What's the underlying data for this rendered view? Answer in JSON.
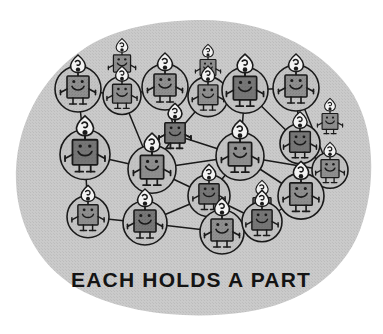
{
  "illustration": {
    "title": "each-holds-a-part-network-illustration",
    "caption": "EACH HOLDS A PART",
    "background_color": "#ffffff",
    "blob_color": "#c9c9c9",
    "blob_texture_color": "#bdbdbd",
    "figure_body_color": "#8c8c8c",
    "figure_body_dark_color": "#707070",
    "figure_outline_color": "#1a1a1a",
    "node_circle_fill": "#c2c2c2",
    "flame_color": "#f2f2f2",
    "link_color": "#1a1a1a",
    "caption_color": "#141414",
    "icon_names": [
      "candle-figure-icon",
      "flame-icon",
      "smiley-face-icon",
      "network-link-icon",
      "node-circle-icon",
      "blob-shape-icon"
    ],
    "counts": {
      "figures": 22,
      "links": 33,
      "circled_nodes": 14
    },
    "figures": [
      {
        "id": "f01",
        "x": 78,
        "y": 85,
        "scale": 1.0,
        "circled": true,
        "circle_r": 23,
        "tone": "light"
      },
      {
        "id": "f02",
        "x": 122,
        "y": 92,
        "scale": 0.86,
        "circled": true,
        "circle_r": 19,
        "tone": "mid"
      },
      {
        "id": "f03",
        "x": 165,
        "y": 83,
        "scale": 1.0,
        "circled": true,
        "circle_r": 23,
        "tone": "light"
      },
      {
        "id": "f04",
        "x": 208,
        "y": 93,
        "scale": 0.9,
        "circled": true,
        "circle_r": 20,
        "tone": "mid"
      },
      {
        "id": "f05",
        "x": 245,
        "y": 86,
        "scale": 1.06,
        "circled": true,
        "circle_r": 23,
        "tone": "dark"
      },
      {
        "id": "f06",
        "x": 296,
        "y": 84,
        "scale": 1.0,
        "circled": true,
        "circle_r": 23,
        "tone": "light"
      },
      {
        "id": "f07",
        "x": 85,
        "y": 150,
        "scale": 1.14,
        "circled": true,
        "circle_r": 25,
        "tone": "dark"
      },
      {
        "id": "f08",
        "x": 175,
        "y": 131,
        "scale": 0.92,
        "circled": false,
        "circle_r": 0,
        "tone": "dark"
      },
      {
        "id": "f09",
        "x": 152,
        "y": 165,
        "scale": 1.06,
        "circled": true,
        "circle_r": 24,
        "tone": "light"
      },
      {
        "id": "f10",
        "x": 240,
        "y": 152,
        "scale": 1.06,
        "circled": true,
        "circle_r": 24,
        "tone": "light"
      },
      {
        "id": "f11",
        "x": 300,
        "y": 140,
        "scale": 0.94,
        "circled": true,
        "circle_r": 20,
        "tone": "dark"
      },
      {
        "id": "f12",
        "x": 330,
        "y": 167,
        "scale": 0.82,
        "circled": true,
        "circle_r": 18,
        "tone": "mid"
      },
      {
        "id": "f13",
        "x": 209,
        "y": 192,
        "scale": 0.92,
        "circled": true,
        "circle_r": 21,
        "tone": "dark"
      },
      {
        "id": "f14",
        "x": 301,
        "y": 192,
        "scale": 1.02,
        "circled": true,
        "circle_r": 23,
        "tone": "light"
      },
      {
        "id": "f15",
        "x": 88,
        "y": 213,
        "scale": 0.92,
        "circled": true,
        "circle_r": 21,
        "tone": "light"
      },
      {
        "id": "f16",
        "x": 145,
        "y": 219,
        "scale": 1.0,
        "circled": true,
        "circle_r": 22,
        "tone": "dark"
      },
      {
        "id": "f17",
        "x": 222,
        "y": 228,
        "scale": 1.0,
        "circled": true,
        "circle_r": 22,
        "tone": "light"
      },
      {
        "id": "f18",
        "x": 262,
        "y": 218,
        "scale": 0.92,
        "circled": true,
        "circle_r": 20,
        "tone": "dark"
      }
    ],
    "links": [
      [
        "f01",
        "f02"
      ],
      [
        "f02",
        "f03"
      ],
      [
        "f03",
        "f04"
      ],
      [
        "f04",
        "f05"
      ],
      [
        "f05",
        "f06"
      ],
      [
        "f01",
        "f07"
      ],
      [
        "f02",
        "f09"
      ],
      [
        "f03",
        "f08"
      ],
      [
        "f04",
        "f08"
      ],
      [
        "f05",
        "f10"
      ],
      [
        "f06",
        "f11"
      ],
      [
        "f06",
        "f12"
      ],
      [
        "f11",
        "f12"
      ],
      [
        "f05",
        "f11"
      ],
      [
        "f07",
        "f09"
      ],
      [
        "f08",
        "f09"
      ],
      [
        "f08",
        "f10"
      ],
      [
        "f09",
        "f10"
      ],
      [
        "f10",
        "f12"
      ],
      [
        "f10",
        "f13"
      ],
      [
        "f10",
        "f14"
      ],
      [
        "f12",
        "f14"
      ],
      [
        "f09",
        "f13"
      ],
      [
        "f09",
        "f16"
      ],
      [
        "f07",
        "f15"
      ],
      [
        "f15",
        "f16"
      ],
      [
        "f13",
        "f16"
      ],
      [
        "f13",
        "f17"
      ],
      [
        "f16",
        "f17"
      ],
      [
        "f17",
        "f18"
      ],
      [
        "f18",
        "f14"
      ],
      [
        "f13",
        "f18"
      ],
      [
        "f11",
        "f14"
      ]
    ]
  }
}
